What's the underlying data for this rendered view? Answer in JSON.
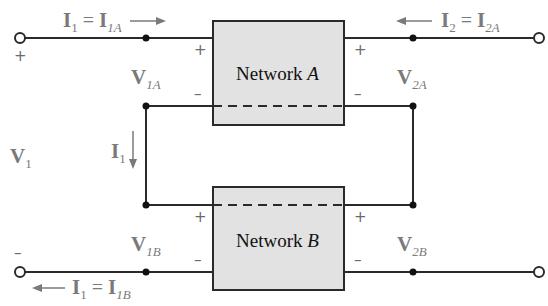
{
  "diagram": {
    "title": "",
    "networks": [
      {
        "id": "A",
        "name": "Network",
        "suffix": "A"
      },
      {
        "id": "B",
        "name": "Network",
        "suffix": "B"
      }
    ],
    "labels": {
      "i1_top": {
        "lhs": "I",
        "lhs_sub": "1",
        "eq": "=",
        "rhs": "I",
        "rhs_sub": "1A",
        "arrow": "right"
      },
      "i2_top": {
        "lhs": "I",
        "lhs_sub": "2",
        "eq": "=",
        "rhs": "I",
        "rhs_sub": "2A",
        "arrow": "left"
      },
      "i1_bottom": {
        "lhs": "I",
        "lhs_sub": "1",
        "eq": "=",
        "rhs": "I",
        "rhs_sub": "1B",
        "arrow": "left"
      },
      "i1_mid": {
        "sym": "I",
        "sub": "1",
        "arrow": "down"
      },
      "v1": {
        "sym": "V",
        "sub": "1"
      },
      "v1a": {
        "sym": "V",
        "sub": "1A"
      },
      "v2a": {
        "sym": "V",
        "sub": "2A"
      },
      "v1b": {
        "sym": "V",
        "sub": "1B"
      },
      "v2b": {
        "sym": "V",
        "sub": "2B"
      }
    },
    "polarity": {
      "plus": "+",
      "minus": "–"
    },
    "colors": {
      "wire": "#2a2a2a",
      "box_fill": "#e2e2e2",
      "label": "#7a7a7a",
      "box_text": "#111111"
    }
  }
}
